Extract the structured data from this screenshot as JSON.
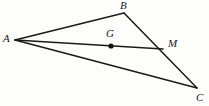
{
  "figure": {
    "type": "geometry-diagram",
    "width": 209,
    "height": 106,
    "background_color": "#fdfdfc",
    "stroke_color": "#1a1a1a",
    "label_color": "#1a1a1a",
    "points": [
      {
        "name": "A",
        "label": "A",
        "x": 15,
        "y": 40,
        "label_x": 3,
        "label_y": 33,
        "marked": false
      },
      {
        "name": "B",
        "label": "B",
        "x": 124,
        "y": 13,
        "label_x": 120,
        "label_y": 0,
        "marked": false
      },
      {
        "name": "C",
        "label": "C",
        "x": 197,
        "y": 88,
        "label_x": 196,
        "label_y": 92,
        "marked": false
      },
      {
        "name": "M",
        "label": "M",
        "x": 163,
        "y": 49,
        "label_x": 168,
        "label_y": 38,
        "marked": false
      },
      {
        "name": "G",
        "label": "G",
        "x": 111,
        "y": 46,
        "label_x": 106,
        "label_y": 28,
        "marked": true
      }
    ],
    "segments": [
      {
        "name": "AB",
        "from": "A",
        "to": "B",
        "x1": 15,
        "y1": 40,
        "x2": 124,
        "y2": 13,
        "width": 1.5
      },
      {
        "name": "BC",
        "from": "B",
        "to": "C",
        "x1": 124,
        "y1": 13,
        "x2": 197,
        "y2": 88,
        "width": 1.5
      },
      {
        "name": "CA",
        "from": "C",
        "to": "A",
        "x1": 197,
        "y1": 88,
        "x2": 15,
        "y2": 40,
        "width": 1.5
      },
      {
        "name": "AM",
        "from": "A",
        "to": "M",
        "x1": 15,
        "y1": 40,
        "x2": 163,
        "y2": 49,
        "width": 1.5
      }
    ],
    "dots": [
      {
        "name": "G",
        "cx": 111,
        "cy": 46,
        "r": 2.6
      }
    ]
  }
}
